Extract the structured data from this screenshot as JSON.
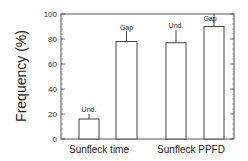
{
  "chart_data": {
    "type": "bar",
    "title": "",
    "xlabel": "",
    "ylabel": "Frequency (%)",
    "ylim": [
      0,
      100
    ],
    "yticks": [
      0,
      20,
      40,
      60,
      80,
      100
    ],
    "grid": false,
    "legend": null,
    "groups": [
      {
        "label": "Sunfleck time",
        "bars": [
          {
            "label": "Und.",
            "value": 16,
            "error_top": 20
          },
          {
            "label": "Gap",
            "value": 78,
            "error_top": 86
          }
        ]
      },
      {
        "label": "Sunfleck PPFD",
        "bars": [
          {
            "label": "Und.",
            "value": 77,
            "error_top": 87
          },
          {
            "label": "Gap",
            "value": 90,
            "error_top": 100
          }
        ]
      }
    ],
    "categories": [
      "Sunfleck time",
      "Sunfleck PPFD"
    ],
    "series": [
      {
        "name": "Und.",
        "values": [
          16,
          77
        ]
      },
      {
        "name": "Gap",
        "values": [
          78,
          90
        ]
      }
    ]
  },
  "labels": {
    "ylabel": "Frequency (%)",
    "group1": "Sunfleck time",
    "group2": "Sunfleck PPFD"
  }
}
